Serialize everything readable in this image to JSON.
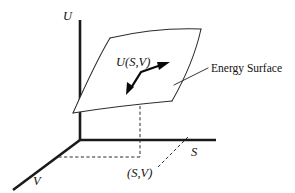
{
  "figure": {
    "background_color": "#ffffff",
    "line_color": "#2b2b2b",
    "axis_color": "#1a1a1a",
    "axes": [
      {
        "id": "u",
        "label": "U",
        "orientation": "vertical",
        "label_x": 67,
        "label_y": 19
      },
      {
        "id": "s",
        "label": "S",
        "orientation": "horizontal-right",
        "label_x": 192,
        "label_y": 155
      },
      {
        "id": "v",
        "label": "V",
        "orientation": "diagonal-down-left",
        "label_x": 34,
        "label_y": 184
      }
    ],
    "surface": {
      "name": "energy-surface",
      "callout_label": "Energy Surface",
      "callout_x": 211,
      "callout_y": 72,
      "corners": [
        {
          "x": 110,
          "y": 38
        },
        {
          "x": 201,
          "y": 29
        },
        {
          "x": 172,
          "y": 101
        },
        {
          "x": 73,
          "y": 113
        }
      ]
    },
    "gradient_arrow": {
      "label": "U(S,V)",
      "label_x": 117,
      "label_y": 65,
      "from": {
        "x": 127,
        "y": 93
      },
      "bend": {
        "x": 141,
        "y": 72
      },
      "to": {
        "x": 169,
        "y": 63
      },
      "double_headed": true
    },
    "projection_point": {
      "label": "(S,V)",
      "label_x": 128,
      "label_y": 176,
      "x": 140,
      "y": 157
    },
    "dashed_guides": [
      {
        "name": "vertical-drop",
        "x1": 140,
        "y1": 107,
        "x2": 140,
        "y2": 157
      },
      {
        "name": "horizontal-to-v-axis",
        "x1": 140,
        "y1": 157,
        "x2": 57,
        "y2": 157
      },
      {
        "name": "point-leader",
        "x1": 157,
        "y1": 168,
        "x2": 188,
        "y2": 136
      }
    ]
  }
}
